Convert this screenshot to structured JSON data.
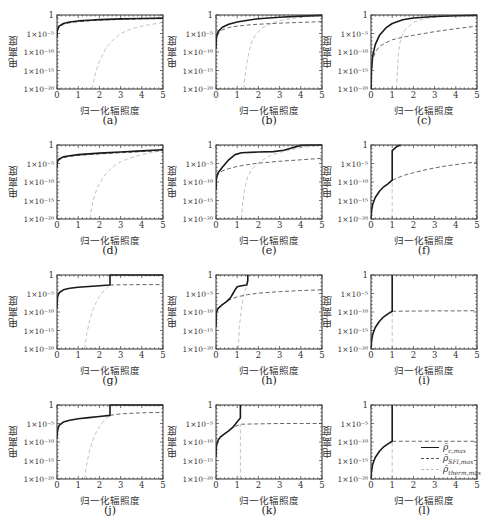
{
  "figure": {
    "ylabel": "电离度",
    "xlabel": "归一化辐照度",
    "y_ticks": [
      "1",
      "1×10⁻⁵",
      "1×10⁻¹⁰",
      "1×10⁻¹⁵",
      "1×10⁻²⁰"
    ],
    "x_ticks": [
      "0",
      "1",
      "2",
      "3",
      "4",
      "5"
    ],
    "legend": [
      {
        "symbol": "ρ̄",
        "sub": "c,max",
        "style": "solid",
        "color": "#1a1a1a"
      },
      {
        "symbol": "ρ̄",
        "sub": "SFI,max",
        "style": "dashed",
        "color": "#555555"
      },
      {
        "symbol": "ρ̄",
        "sub": "therm,max",
        "style": "dashed",
        "color": "#bdbdbd"
      }
    ]
  },
  "chart_data": [
    {
      "id": "a",
      "caption": "(a)",
      "type": "line",
      "xlim": [
        0,
        5
      ],
      "ylim_log10": [
        -20,
        0
      ],
      "series": [
        {
          "name": "rho_c_max",
          "x": [
            0,
            0.02,
            0.1,
            0.3,
            0.6,
            1,
            1.5,
            2,
            3,
            4,
            5
          ],
          "log10y": [
            -6,
            -4,
            -3,
            -2.3,
            -1.9,
            -1.6,
            -1.4,
            -1.25,
            -1.05,
            -0.95,
            -0.85
          ]
        },
        {
          "name": "rho_SFI_max",
          "x": [
            0,
            0.02,
            0.1,
            0.3,
            0.6,
            1,
            1.5,
            2,
            3,
            4,
            5
          ],
          "log10y": [
            -6,
            -4.2,
            -3.2,
            -2.5,
            -2.1,
            -1.8,
            -1.6,
            -1.4,
            -1.2,
            -1.05,
            -0.95
          ]
        },
        {
          "name": "rho_therm_max",
          "x": [
            1.65,
            1.8,
            2,
            2.3,
            2.6,
            3,
            3.5,
            4,
            4.5,
            5
          ],
          "log10y": [
            -20,
            -16,
            -12.5,
            -9,
            -7,
            -5,
            -3.8,
            -3,
            -2.5,
            -2
          ]
        }
      ]
    },
    {
      "id": "b",
      "caption": "(b)",
      "type": "line",
      "xlim": [
        0,
        5
      ],
      "ylim_log10": [
        -20,
        0
      ],
      "series": [
        {
          "name": "rho_c_max",
          "x": [
            0,
            0.02,
            0.1,
            0.3,
            0.6,
            1,
            1.5,
            2,
            3,
            4,
            5
          ],
          "log10y": [
            -9,
            -6,
            -4.5,
            -3.3,
            -2.5,
            -1.9,
            -1.4,
            -1.0,
            -0.6,
            -0.3,
            -0.1
          ]
        },
        {
          "name": "rho_SFI_max",
          "x": [
            0,
            0.02,
            0.1,
            0.3,
            0.6,
            1,
            1.5,
            2,
            3,
            4,
            5
          ],
          "log10y": [
            -9,
            -6.5,
            -5,
            -4,
            -3.4,
            -3,
            -2.7,
            -2.5,
            -2.2,
            -2,
            -1.8
          ]
        },
        {
          "name": "rho_therm_max",
          "x": [
            1.3,
            1.4,
            1.55,
            1.7,
            1.9,
            2.2,
            2.6,
            3,
            4,
            5
          ],
          "log10y": [
            -20,
            -15,
            -10,
            -7,
            -5,
            -3.5,
            -2.3,
            -1.5,
            -0.6,
            -0.2
          ]
        }
      ]
    },
    {
      "id": "c",
      "caption": "(c)",
      "type": "line",
      "xlim": [
        0,
        5
      ],
      "ylim_log10": [
        -20,
        0
      ],
      "series": [
        {
          "name": "rho_c_max",
          "x": [
            0,
            0.02,
            0.08,
            0.2,
            0.4,
            0.7,
            1,
            1.5,
            2,
            3,
            4,
            5
          ],
          "log10y": [
            -20,
            -15,
            -11,
            -8,
            -5.5,
            -3.5,
            -2.3,
            -1.3,
            -0.8,
            -0.4,
            -0.2,
            -0.1
          ]
        },
        {
          "name": "rho_SFI_max",
          "x": [
            0,
            0.02,
            0.08,
            0.2,
            0.4,
            0.7,
            1,
            1.5,
            2,
            3,
            4,
            5
          ],
          "log10y": [
            -20,
            -15,
            -12,
            -10,
            -8.5,
            -7.5,
            -6.7,
            -6,
            -5.5,
            -4.5,
            -3.7,
            -3
          ]
        },
        {
          "name": "rho_therm_max",
          "x": [
            1.2,
            1.25,
            1.3,
            1.4,
            1.6,
            2,
            2.5,
            3,
            4,
            5
          ],
          "log10y": [
            -20,
            -15,
            -10,
            -6.5,
            -4,
            -2,
            -1,
            -0.6,
            -0.2,
            -0.05
          ]
        }
      ]
    },
    {
      "id": "d",
      "caption": "(d)",
      "type": "line",
      "xlim": [
        0,
        5
      ],
      "ylim_log10": [
        -20,
        0
      ],
      "series": [
        {
          "name": "rho_c_max",
          "x": [
            0,
            0.02,
            0.1,
            0.3,
            0.6,
            1,
            1.5,
            2,
            3,
            4,
            5
          ],
          "log10y": [
            -6,
            -4.5,
            -3.8,
            -3.2,
            -2.9,
            -2.6,
            -2.4,
            -2.2,
            -1.9,
            -1.6,
            -1.3
          ]
        },
        {
          "name": "rho_SFI_max",
          "x": [
            0,
            0.02,
            0.1,
            0.3,
            0.6,
            1,
            1.5,
            2,
            3,
            4,
            5
          ],
          "log10y": [
            -6,
            -4.8,
            -4,
            -3.4,
            -3.1,
            -2.8,
            -2.6,
            -2.4,
            -2.1,
            -1.8,
            -1.5
          ]
        },
        {
          "name": "rho_therm_max",
          "x": [
            1.55,
            1.7,
            1.9,
            2.2,
            2.6,
            3,
            3.5,
            4,
            4.5,
            5
          ],
          "log10y": [
            -20,
            -15,
            -11.5,
            -8.5,
            -6,
            -4.5,
            -3.4,
            -2.6,
            -2,
            -1.5
          ]
        }
      ]
    },
    {
      "id": "e",
      "caption": "(e)",
      "type": "line",
      "xlim": [
        0,
        5
      ],
      "ylim_log10": [
        -20,
        0
      ],
      "series": [
        {
          "name": "rho_c_max",
          "x": [
            0,
            0.02,
            0.1,
            0.3,
            0.6,
            0.9,
            1.2,
            2,
            2.7,
            3.2,
            4,
            4.5,
            5
          ],
          "log10y": [
            -12,
            -9,
            -7.5,
            -6,
            -4,
            -2.6,
            -2.1,
            -1.9,
            -1.8,
            -1.4,
            -0.1,
            0,
            0
          ]
        },
        {
          "name": "rho_SFI_max",
          "x": [
            0,
            0.02,
            0.1,
            0.3,
            0.6,
            1,
            1.5,
            2,
            3,
            4,
            5
          ],
          "log10y": [
            -12,
            -9,
            -7.8,
            -7,
            -6.4,
            -5.8,
            -5.3,
            -4.9,
            -4.4,
            -4,
            -3.6
          ]
        },
        {
          "name": "rho_therm_max",
          "x": [
            1.2,
            1.25,
            1.35,
            1.5,
            1.7,
            2,
            2.5,
            3,
            4,
            5
          ],
          "log10y": [
            -20,
            -16,
            -12,
            -8.5,
            -6.5,
            -4.8,
            -3,
            -2,
            -0.7,
            0
          ]
        }
      ]
    },
    {
      "id": "f",
      "caption": "(f)",
      "type": "line",
      "xlim": [
        0,
        5
      ],
      "ylim_log10": [
        -20,
        0
      ],
      "series": [
        {
          "name": "rho_c_max",
          "x": [
            0,
            0.02,
            0.08,
            0.2,
            0.4,
            0.6,
            0.8,
            1,
            1,
            1.2,
            1.4
          ],
          "log10y": [
            -20,
            -18,
            -16,
            -14.2,
            -12.5,
            -11.3,
            -10.5,
            -9.5,
            -1.5,
            -0.5,
            0
          ]
        },
        {
          "name": "rho_SFI_max",
          "x": [
            1,
            1.5,
            2,
            2.5,
            3,
            3.5,
            4,
            4.5,
            5
          ],
          "log10y": [
            -9.5,
            -8.3,
            -7.5,
            -6.8,
            -6.2,
            -5.7,
            -5.3,
            -4.9,
            -4.6
          ]
        },
        {
          "name": "rho_therm_max",
          "x": [
            1,
            1,
            1
          ],
          "log10y": [
            -20,
            -15,
            -9.5
          ]
        }
      ]
    },
    {
      "id": "g",
      "caption": "(g)",
      "type": "line",
      "xlim": [
        0,
        5
      ],
      "ylim_log10": [
        -20,
        0
      ],
      "series": [
        {
          "name": "rho_c_max",
          "x": [
            0,
            0.02,
            0.1,
            0.3,
            0.6,
            1,
            1.5,
            2,
            2.5,
            2.5,
            5
          ],
          "log10y": [
            -9,
            -6,
            -4.8,
            -4.0,
            -3.6,
            -3.3,
            -3.1,
            -2.9,
            -2.7,
            0,
            0
          ]
        },
        {
          "name": "rho_SFI_max",
          "x": [
            2.5,
            3,
            4,
            5
          ],
          "log10y": [
            -2.7,
            -2.65,
            -2.6,
            -2.6
          ]
        },
        {
          "name": "rho_therm_max",
          "x": [
            1.3,
            1.4,
            1.55,
            1.75,
            2,
            2.25,
            2.5
          ],
          "log10y": [
            -20,
            -16,
            -12,
            -8.5,
            -5.8,
            -4,
            -2.7
          ]
        }
      ]
    },
    {
      "id": "h",
      "caption": "(h)",
      "type": "line",
      "xlim": [
        0,
        5
      ],
      "ylim_log10": [
        -20,
        0
      ],
      "series": [
        {
          "name": "rho_c_max",
          "x": [
            0,
            0.02,
            0.1,
            0.3,
            0.5,
            0.7,
            0.8,
            0.9,
            1,
            1.2,
            1.45,
            1.5,
            1.5
          ],
          "log10y": [
            -14,
            -10,
            -9,
            -8,
            -7.2,
            -6,
            -5,
            -4,
            -3.2,
            -2.9,
            -2.7,
            -1.5,
            0
          ]
        },
        {
          "name": "rho_SFI_max",
          "x": [
            0.3,
            0.6,
            1,
            1.5,
            2,
            3,
            4,
            5
          ],
          "log10y": [
            -8,
            -6.8,
            -5.9,
            -5.3,
            -4.9,
            -4.5,
            -4.2,
            -4
          ]
        },
        {
          "name": "rho_therm_max",
          "x": [
            1.05,
            1.1,
            1.2,
            1.3,
            1.45,
            1.5
          ],
          "log10y": [
            -20,
            -14,
            -9,
            -5.5,
            -3,
            -2.7
          ]
        }
      ]
    },
    {
      "id": "i",
      "caption": "(i)",
      "type": "line",
      "xlim": [
        0,
        5
      ],
      "ylim_log10": [
        -20,
        0
      ],
      "series": [
        {
          "name": "rho_c_max",
          "x": [
            0,
            0.02,
            0.08,
            0.2,
            0.4,
            0.6,
            0.8,
            1,
            1
          ],
          "log10y": [
            -20,
            -18,
            -16,
            -14.2,
            -12.5,
            -11.3,
            -10.5,
            -9.8,
            0
          ]
        },
        {
          "name": "rho_SFI_max",
          "x": [
            1,
            2,
            3,
            4,
            5
          ],
          "log10y": [
            -9.8,
            -9.75,
            -9.7,
            -9.7,
            -9.65
          ]
        },
        {
          "name": "rho_therm_max",
          "x": [
            1,
            1
          ],
          "log10y": [
            -20,
            -9.8
          ]
        }
      ]
    },
    {
      "id": "j",
      "caption": "(j)",
      "type": "line",
      "xlim": [
        0,
        5
      ],
      "ylim_log10": [
        -20,
        0
      ],
      "series": [
        {
          "name": "rho_c_max",
          "x": [
            0,
            0.02,
            0.1,
            0.3,
            0.6,
            1,
            1.5,
            2,
            2.5,
            2.5,
            5
          ],
          "log10y": [
            -9,
            -7,
            -5.5,
            -4.6,
            -4.1,
            -3.7,
            -3.4,
            -3.1,
            -2.8,
            0,
            0
          ]
        },
        {
          "name": "rho_SFI_max",
          "x": [
            2.5,
            3,
            4,
            5
          ],
          "log10y": [
            -2.8,
            -2.4,
            -2.1,
            -2
          ]
        },
        {
          "name": "rho_therm_max",
          "x": [
            1.3,
            1.4,
            1.55,
            1.75,
            2,
            2.25,
            2.5
          ],
          "log10y": [
            -20,
            -16,
            -12,
            -8.5,
            -5.8,
            -4,
            -2.8
          ]
        }
      ]
    },
    {
      "id": "k",
      "caption": "(k)",
      "type": "line",
      "xlim": [
        0,
        5
      ],
      "ylim_log10": [
        -20,
        0
      ],
      "series": [
        {
          "name": "rho_c_max",
          "x": [
            0,
            0.02,
            0.1,
            0.2,
            0.4,
            0.6,
            0.8,
            1,
            1.15,
            1.15
          ],
          "log10y": [
            -14,
            -11,
            -9.5,
            -8.7,
            -7.8,
            -7,
            -6,
            -4.5,
            -3.5,
            0
          ]
        },
        {
          "name": "rho_SFI_max",
          "x": [
            0.9,
            1.15,
            2,
            3,
            4,
            5
          ],
          "log10y": [
            -5.8,
            -5.2,
            -5.1,
            -5,
            -5,
            -5
          ]
        },
        {
          "name": "rho_therm_max",
          "x": [
            1.15,
            1.15
          ],
          "log10y": [
            -20,
            -5.2
          ]
        }
      ]
    },
    {
      "id": "l",
      "caption": "(l)",
      "type": "line",
      "xlim": [
        0,
        5
      ],
      "ylim_log10": [
        -20,
        0
      ],
      "series": [
        {
          "name": "rho_c_max",
          "x": [
            0,
            0.02,
            0.08,
            0.2,
            0.4,
            0.6,
            0.8,
            1,
            1
          ],
          "log10y": [
            -20,
            -18,
            -16,
            -14.2,
            -12.5,
            -11.3,
            -10.5,
            -9.8,
            0
          ]
        },
        {
          "name": "rho_SFI_max",
          "x": [
            1,
            2,
            3,
            4,
            5
          ],
          "log10y": [
            -9.8,
            -9.8,
            -9.8,
            -9.8,
            -9.8
          ]
        },
        {
          "name": "rho_therm_max",
          "x": [
            1,
            1
          ],
          "log10y": [
            -20,
            -9.8
          ]
        }
      ],
      "has_legend": true
    }
  ],
  "style": {
    "rho_c_max": {
      "color": "#1a1a1a",
      "width": 1.6,
      "dash": ""
    },
    "rho_SFI_max": {
      "color": "#555555",
      "width": 0.9,
      "dash": "4,2.5"
    },
    "rho_therm_max": {
      "color": "#bdbdbd",
      "width": 0.9,
      "dash": "4,2.5"
    },
    "frame_color": "#333333"
  }
}
